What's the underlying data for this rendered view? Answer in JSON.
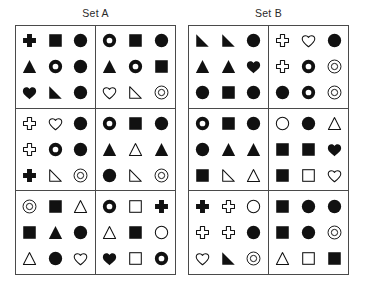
{
  "page": {
    "background": "#ffffff",
    "ink": "#111111",
    "width": 369,
    "height": 294
  },
  "sets": [
    {
      "id": "set-a",
      "title": "Set A",
      "cells": [
        {
          "id": "a1",
          "rows": [
            [
              "cross-filled",
              "square-filled",
              "circle-filled"
            ],
            [
              "triangle-filled",
              "donut-filled",
              "circle-filled"
            ],
            [
              "heart-filled",
              "corner-triangle-filled",
              "circle-filled"
            ]
          ]
        },
        {
          "id": "a2",
          "rows": [
            [
              "donut-filled",
              "square-filled",
              "circle-filled"
            ],
            [
              "triangle-filled",
              "donut-filled",
              "square-filled"
            ],
            [
              "heart-outline",
              "corner-triangle-outline",
              "double-circle-outline"
            ]
          ]
        },
        {
          "id": "a3",
          "rows": [
            [
              "cross-outline",
              "heart-outline",
              "circle-filled"
            ],
            [
              "cross-outline",
              "donut-filled",
              "circle-filled"
            ],
            [
              "cross-filled",
              "corner-triangle-outline",
              "double-circle-outline"
            ]
          ]
        },
        {
          "id": "a4",
          "rows": [
            [
              "donut-filled",
              "square-filled",
              "circle-filled"
            ],
            [
              "triangle-filled",
              "triangle-outline",
              "triangle-filled"
            ],
            [
              "circle-filled",
              "corner-triangle-outline",
              "double-circle-outline"
            ]
          ]
        },
        {
          "id": "a5",
          "rows": [
            [
              "double-circle-outline",
              "square-filled",
              "triangle-outline"
            ],
            [
              "square-filled",
              "triangle-filled",
              "circle-filled"
            ],
            [
              "triangle-outline",
              "circle-filled",
              "heart-outline"
            ]
          ]
        },
        {
          "id": "a6",
          "rows": [
            [
              "donut-filled",
              "square-outline",
              "cross-filled"
            ],
            [
              "triangle-outline",
              "square-filled",
              "circle-outline"
            ],
            [
              "heart-filled",
              "square-outline",
              "donut-filled"
            ]
          ]
        }
      ]
    },
    {
      "id": "set-b",
      "title": "Set B",
      "cells": [
        {
          "id": "b1",
          "rows": [
            [
              "corner-triangle-filled",
              "corner-triangle-filled",
              "circle-filled"
            ],
            [
              "triangle-filled",
              "triangle-filled",
              "heart-filled"
            ],
            [
              "circle-filled",
              "square-filled",
              "circle-filled"
            ]
          ]
        },
        {
          "id": "b2",
          "rows": [
            [
              "cross-outline",
              "heart-outline",
              "circle-filled"
            ],
            [
              "cross-outline",
              "donut-filled",
              "double-circle-outline"
            ],
            [
              "circle-filled",
              "donut-filled",
              "double-circle-outline"
            ]
          ]
        },
        {
          "id": "b3",
          "rows": [
            [
              "donut-filled",
              "square-filled",
              "circle-filled"
            ],
            [
              "circle-filled",
              "triangle-filled",
              "triangle-filled"
            ],
            [
              "square-filled",
              "corner-triangle-outline",
              "triangle-outline"
            ]
          ]
        },
        {
          "id": "b4",
          "rows": [
            [
              "circle-outline",
              "circle-filled",
              "triangle-outline"
            ],
            [
              "square-filled",
              "square-filled",
              "heart-filled"
            ],
            [
              "square-filled",
              "square-outline",
              "heart-outline"
            ]
          ]
        },
        {
          "id": "b5",
          "rows": [
            [
              "cross-filled",
              "cross-outline",
              "circle-outline"
            ],
            [
              "cross-outline",
              "cross-outline",
              "circle-filled"
            ],
            [
              "heart-outline",
              "corner-triangle-filled",
              "double-circle-outline"
            ]
          ]
        },
        {
          "id": "b6",
          "rows": [
            [
              "square-filled",
              "circle-filled",
              "circle-filled"
            ],
            [
              "square-filled",
              "circle-filled",
              "double-circle-outline"
            ],
            [
              "triangle-outline",
              "square-outline",
              "square-filled"
            ]
          ]
        }
      ]
    }
  ]
}
